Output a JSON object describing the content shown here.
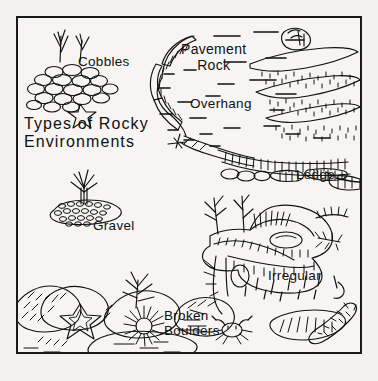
{
  "figure": {
    "kind": "line-art-diagram",
    "subject": "Types of Rocky Environments",
    "border_color": "#1a1a1a",
    "ink_color": "#111111",
    "paper_color": "#f6f5f3"
  },
  "title": {
    "line1": "Types of Rocky",
    "line2": "Environments"
  },
  "labels": {
    "cobbles": "Cobbles",
    "gravel": "Gravel",
    "pavement_rock_line1": "Pavement",
    "pavement_rock_line2": "Rock",
    "overhang": "Overhang",
    "ledge": "Ledge",
    "irregular": "Irregular",
    "broken_line1": "Broken",
    "broken_line2": "Boulders"
  },
  "illustrations": [
    {
      "name": "cobbles-pile",
      "description": "mound of rounded oval cobbles with two seaweed fronds and a starfish"
    },
    {
      "name": "gravel-mound",
      "description": "low mound of small pebbles with a plant tuft sprouting from the top"
    },
    {
      "name": "pavement-rock-slab",
      "description": "curving flat rock edge with hatched vertical face"
    },
    {
      "name": "overhang-rock",
      "description": "undercut rock face below the pavement rock"
    },
    {
      "name": "ledge-band",
      "description": "horizontal band of hatched blocky stones forming a ledge"
    },
    {
      "name": "kelp-blades",
      "description": "three curved kelp blades over stippled sand texture"
    },
    {
      "name": "snail-shell",
      "description": "spiral snail shell resting on the bottom"
    },
    {
      "name": "irregular-outcrop",
      "description": "complex jagged rock outcrop with crevices, seaweed and anemones"
    },
    {
      "name": "broken-boulders",
      "description": "cluster of angular hatched boulders with starfish and sea urchin"
    },
    {
      "name": "crab",
      "description": "small crab with claws and legs"
    },
    {
      "name": "sea-cucumber",
      "description": "elongated segmented worm-like animal"
    },
    {
      "name": "water-dashes",
      "description": "short horizontal dashes indicating open water"
    }
  ]
}
